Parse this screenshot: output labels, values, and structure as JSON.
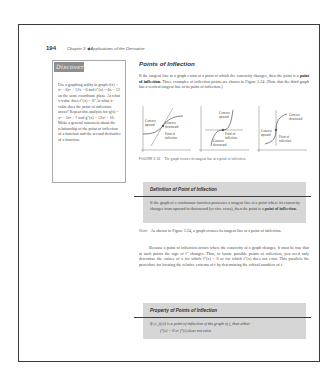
{
  "page": {
    "number": "194",
    "chapter_title": "Chapter 3 ◆ Applications of the Derivative"
  },
  "discovery": {
    "heading": "Discovery",
    "body": "Use a graphing utility to graph f(x) = x³ − 6x² + 12x − 6 and f″(x) = 6x − 12 on the same coordinate plane. At what x-value does f″(x) = 0? At what x-value does the point of inflection occur? Repeat this analysis for g(x) = x⁴ − 5x² + 7 and g″(x) = 12x² − 10. Make a general statement about the relationship of the point of inflection of a function and the second derivative of a function."
  },
  "section": {
    "title": "Points of Inflection",
    "intro_before": "If the tangent line to a graph exists at a point at which the concavity changes, then the point is a ",
    "intro_bold": "point of inflection.",
    "intro_after": " Three examples of inflection points are shown in Figure 3.24. (Note that the third graph has a vertical tangent line at its point of inflection.)"
  },
  "figure": {
    "graphs": [
      {
        "upper_label": [
          "Concave",
          "upward"
        ],
        "lower_label": [
          "Concave",
          "downward"
        ],
        "poi_label": [
          "Point of",
          "inflection"
        ]
      },
      {
        "upper_label": [
          "Concave",
          "upward"
        ],
        "lower_label": [
          "Concave",
          "downward"
        ],
        "poi_label": [
          "Point of",
          "inflection"
        ]
      },
      {
        "upper_label": [
          "Concave",
          "downward"
        ],
        "lower_label": [
          "Concave",
          "upward"
        ],
        "poi_label": [
          "Point of",
          "inflection"
        ]
      }
    ],
    "axis_x": "x",
    "axis_y": "y",
    "caption_label": "FIGURE 3.24",
    "caption_text": "The graph crosses its tangent line at a point of inflection."
  },
  "definition_box": {
    "title": "Definition of Point of Inflection",
    "body_before": "If the graph of a continuous function possesses a tangent line at a point where its concavity changes from upward to downward (or vice versa), then the point is a ",
    "body_bold": "point of inflection."
  },
  "note": {
    "label": "Note",
    "text": "As shown in Figure 3.24, a graph crosses its tangent line at a point of inflection."
  },
  "paragraph2": "Because a point of inflection occurs where the concavity of a graph changes, it must be true that at such points the sign of f″ changes. Thus, to locate possible points of inflection, you need only determine the values of x for which f″(x) = 0 or for which f″(x) does not exist. This parallels the procedure for locating the relative extrema of f by determining the critical numbers of f.",
  "property_box": {
    "title": "Property of Points of Inflection",
    "body": "If (c, f(c)) is a point of inflection of the graph of f, then either",
    "formula": "f″(c) = 0    or    f″(c) does not exist."
  }
}
